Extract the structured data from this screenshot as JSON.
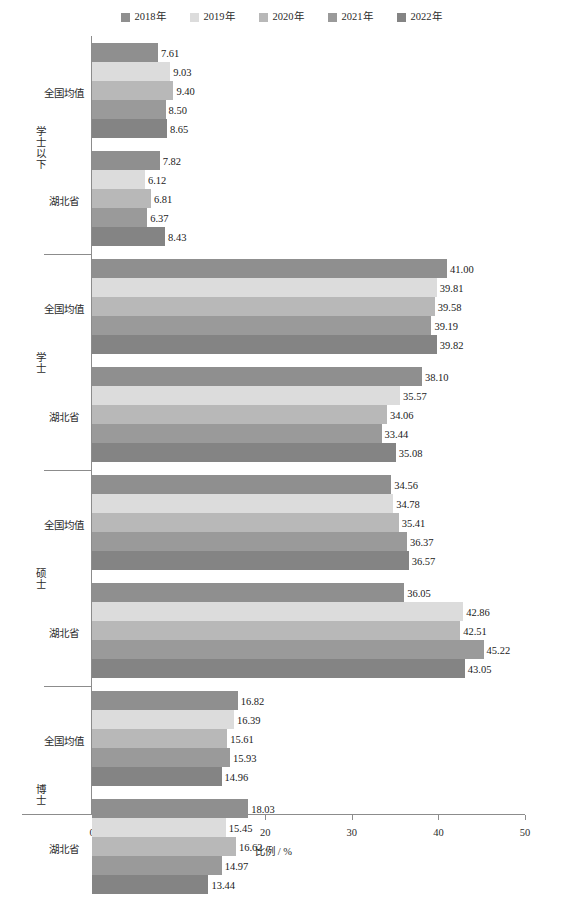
{
  "chart_data": {
    "type": "bar",
    "orientation": "horizontal",
    "title": "",
    "xlabel": "比例 / %",
    "ylabel": "",
    "xlim": [
      0,
      50
    ],
    "xticks": [
      0,
      10,
      20,
      30,
      40,
      50
    ],
    "grid": false,
    "legend_position": "top-center",
    "series": [
      {
        "name": "2018年",
        "color": "#8f8f8f"
      },
      {
        "name": "2019年",
        "color": "#dcdcdc"
      },
      {
        "name": "2020年",
        "color": "#b8b8b8"
      },
      {
        "name": "2021年",
        "color": "#9a9a9a"
      },
      {
        "name": "2022年",
        "color": "#848484"
      }
    ],
    "groups": [
      {
        "label": "学士以下",
        "subgroups": [
          {
            "label": "全国均值",
            "values": [
              7.61,
              9.03,
              9.4,
              8.5,
              8.65
            ]
          },
          {
            "label": "湖北省",
            "values": [
              7.82,
              6.12,
              6.81,
              6.37,
              8.43
            ]
          }
        ]
      },
      {
        "label": "学士",
        "subgroups": [
          {
            "label": "全国均值",
            "values": [
              41.0,
              39.81,
              39.58,
              39.19,
              39.82
            ]
          },
          {
            "label": "湖北省",
            "values": [
              38.1,
              35.57,
              34.06,
              33.44,
              35.08
            ]
          }
        ]
      },
      {
        "label": "硕士",
        "subgroups": [
          {
            "label": "全国均值",
            "values": [
              34.56,
              34.78,
              35.41,
              36.37,
              36.57
            ]
          },
          {
            "label": "湖北省",
            "values": [
              36.05,
              42.86,
              42.51,
              45.22,
              43.05
            ]
          }
        ]
      },
      {
        "label": "博士",
        "subgroups": [
          {
            "label": "全国均值",
            "values": [
              16.82,
              16.39,
              15.61,
              15.93,
              14.96
            ]
          },
          {
            "label": "湖北省",
            "values": [
              18.03,
              15.45,
              16.62,
              14.97,
              13.44
            ]
          }
        ]
      }
    ]
  },
  "caption": ""
}
